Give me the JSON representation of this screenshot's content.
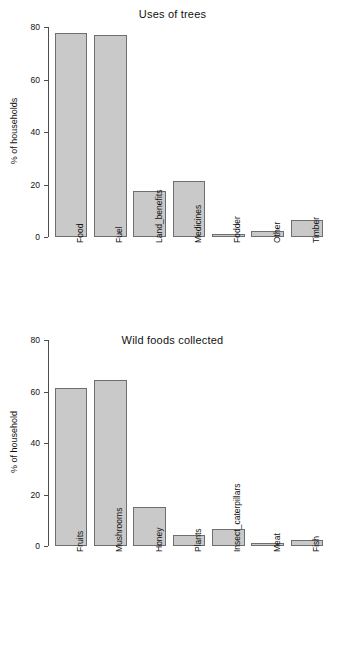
{
  "chart_data": [
    {
      "type": "bar",
      "title": "Uses of trees",
      "xlabel": "",
      "ylabel": "% of households",
      "ylim": [
        0,
        80
      ],
      "yticks": [
        0,
        20,
        40,
        60,
        80
      ],
      "grid": false,
      "legend": "none",
      "categories": [
        "Food",
        "Fuel",
        "Land_benefits",
        "Medicines",
        "Fodder",
        "Other",
        "Timber"
      ],
      "values": [
        77.8,
        77.0,
        17.6,
        21.2,
        1.2,
        2.3,
        6.5
      ],
      "bar_fill_color": "#c9c9c9",
      "bar_border_color": "#6e6e6e"
    },
    {
      "type": "bar",
      "title": "Wild foods collected",
      "xlabel": "",
      "ylabel": "% of household",
      "ylim": [
        0,
        80
      ],
      "yticks": [
        0,
        20,
        40,
        60,
        80
      ],
      "grid": false,
      "legend": "none",
      "categories": [
        "Fruits",
        "Mushrooms",
        "Honey",
        "Plants",
        "Insect_caterpillars",
        "Meat",
        "Fish"
      ],
      "values": [
        61.4,
        64.3,
        15.1,
        4.2,
        6.5,
        1.2,
        2.3
      ],
      "bar_fill_color": "#c9c9c9",
      "bar_border_color": "#6e6e6e"
    }
  ]
}
